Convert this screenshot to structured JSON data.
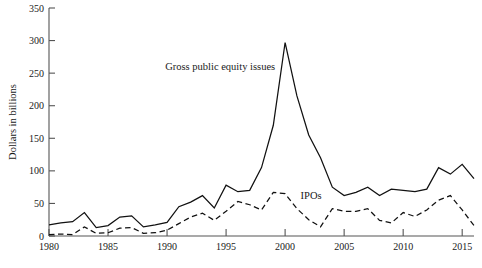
{
  "chart_data": {
    "type": "line",
    "title": "",
    "subtitle": "",
    "xlabel": "",
    "ylabel": "Dollars in billions",
    "xlim": [
      1980,
      2016
    ],
    "ylim": [
      0,
      350
    ],
    "yticks": [
      0,
      50,
      100,
      150,
      200,
      250,
      300,
      350
    ],
    "ytick_labels": [
      "0",
      "50",
      "100",
      "150",
      "200",
      "250",
      "300",
      "350"
    ],
    "xticks": [
      1980,
      1985,
      1990,
      1995,
      2000,
      2005,
      2010,
      2015
    ],
    "xtick_labels": [
      "1980",
      "1985",
      "1990",
      "1995",
      "2000",
      "2005",
      "2010",
      "2015"
    ],
    "grid": false,
    "legend_position": "inline-annotations",
    "x": [
      1980,
      1981,
      1982,
      1983,
      1984,
      1985,
      1986,
      1987,
      1988,
      1989,
      1990,
      1991,
      1992,
      1993,
      1994,
      1995,
      1996,
      1997,
      1998,
      1999,
      2000,
      2001,
      2002,
      2003,
      2004,
      2005,
      2006,
      2007,
      2008,
      2009,
      2010,
      2011,
      2012,
      2013,
      2014,
      2015,
      2016
    ],
    "series": [
      {
        "name": "Gross public equity issues",
        "style": "solid",
        "label_x": 1994.5,
        "label_y": 255,
        "values": [
          17,
          20,
          22,
          36,
          13,
          16,
          29,
          31,
          14,
          17,
          21,
          45,
          52,
          62,
          43,
          78,
          68,
          70,
          105,
          170,
          297,
          215,
          155,
          120,
          75,
          62,
          67,
          75,
          62,
          72,
          70,
          68,
          72,
          105,
          95,
          110,
          88
        ]
      },
      {
        "name": "IPOs",
        "style": "dashed",
        "label_x": 2002.2,
        "label_y": 57,
        "values": [
          2,
          3,
          2,
          14,
          4,
          5,
          12,
          13,
          4,
          5,
          9,
          19,
          29,
          35,
          24,
          38,
          53,
          48,
          40,
          67,
          65,
          42,
          25,
          14,
          42,
          38,
          38,
          42,
          24,
          20,
          36,
          30,
          40,
          55,
          62,
          40,
          16
        ]
      }
    ],
    "annotations": [
      {
        "text": "Gross public equity issues"
      },
      {
        "text": "IPOs"
      }
    ]
  },
  "axes": {
    "y_axis_title": "Dollars in billions"
  },
  "colors": {
    "series_stroke": "#111111",
    "axis": "#555555",
    "background": "#ffffff"
  }
}
